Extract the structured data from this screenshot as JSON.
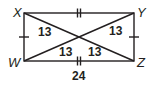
{
  "figure": {
    "shape": "rectangle",
    "stroke_color": "#231f20",
    "vertices": [
      {
        "name": "X",
        "label": "X",
        "x": 24,
        "y": 13
      },
      {
        "name": "Y",
        "label": "Y",
        "x": 134,
        "y": 13
      },
      {
        "name": "Z",
        "label": "Z",
        "x": 134,
        "y": 61
      },
      {
        "name": "W",
        "label": "W",
        "x": 24,
        "y": 61
      }
    ],
    "sides": [
      {
        "from": "X",
        "to": "Y",
        "tick_marks": 2
      },
      {
        "from": "Y",
        "to": "Z",
        "tick_marks": 1
      },
      {
        "from": "Z",
        "to": "W",
        "tick_marks": 2,
        "length_label": "24"
      },
      {
        "from": "W",
        "to": "X",
        "tick_marks": 1
      }
    ],
    "diagonals": [
      {
        "from": "X",
        "to": "Z"
      },
      {
        "from": "W",
        "to": "Y"
      }
    ],
    "segment_labels": {
      "upper_left": "13",
      "upper_right": "13",
      "lower_left": "13",
      "lower_right": "13"
    },
    "bottom_length": "24"
  }
}
